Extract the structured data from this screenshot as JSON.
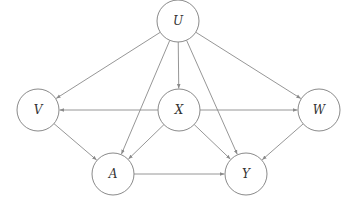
{
  "diagram": {
    "type": "causal-dag",
    "node_radius": 21,
    "colors": {
      "stroke": "#8a8a8a",
      "label": "#333333",
      "background": "#ffffff"
    },
    "nodes": [
      {
        "id": "U",
        "label": "U",
        "x": 178,
        "y": 21
      },
      {
        "id": "V",
        "label": "V",
        "x": 38,
        "y": 110
      },
      {
        "id": "X",
        "label": "X",
        "x": 179,
        "y": 110
      },
      {
        "id": "W",
        "label": "W",
        "x": 319,
        "y": 110
      },
      {
        "id": "A",
        "label": "A",
        "x": 113,
        "y": 174
      },
      {
        "id": "Y",
        "label": "Y",
        "x": 246,
        "y": 174
      }
    ],
    "edges": [
      {
        "from": "U",
        "to": "V"
      },
      {
        "from": "U",
        "to": "X"
      },
      {
        "from": "U",
        "to": "W"
      },
      {
        "from": "U",
        "to": "A"
      },
      {
        "from": "U",
        "to": "Y"
      },
      {
        "from": "X",
        "to": "V"
      },
      {
        "from": "X",
        "to": "W"
      },
      {
        "from": "X",
        "to": "A"
      },
      {
        "from": "X",
        "to": "Y"
      },
      {
        "from": "V",
        "to": "A"
      },
      {
        "from": "W",
        "to": "Y"
      },
      {
        "from": "A",
        "to": "Y"
      }
    ]
  }
}
